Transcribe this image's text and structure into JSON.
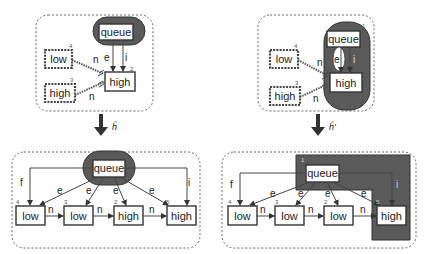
{
  "panels": {
    "top_left": {
      "queue": {
        "label": "queue",
        "num": "1"
      },
      "high": {
        "label": "high",
        "num": "2"
      },
      "low_pattern": {
        "label": "low",
        "num": "4"
      },
      "high_pattern": {
        "label": "high",
        "num": "3"
      },
      "edges": {
        "e": "e",
        "i": "i",
        "n1": "n",
        "n2": "n"
      }
    },
    "top_right": {
      "queue": {
        "label": "queue",
        "num": "1"
      },
      "high": {
        "label": "high",
        "num": "2"
      },
      "low_pattern": {
        "label": "low",
        "num": "4"
      },
      "high_pattern": {
        "label": "high",
        "num": "3"
      },
      "edges": {
        "e": "e",
        "i": "i",
        "n1": "n",
        "n2": "n"
      }
    },
    "bottom_left": {
      "queue": {
        "label": "queue",
        "num": "1"
      },
      "nodes": [
        {
          "label": "low",
          "num": "4"
        },
        {
          "label": "low",
          "num": "3"
        },
        {
          "label": "high",
          "num": "2"
        },
        {
          "label": "high",
          "num": "5"
        }
      ],
      "edges": {
        "f": "f",
        "i": "i",
        "e": "e",
        "n": "n"
      }
    },
    "bottom_right": {
      "queue": {
        "label": "queue",
        "num": "1"
      },
      "nodes": [
        {
          "label": "low",
          "num": "4"
        },
        {
          "label": "low",
          "num": "3"
        },
        {
          "label": "low",
          "num": "2"
        },
        {
          "label": "high",
          "num": "5"
        }
      ],
      "edges": {
        "f": "f",
        "i": "i",
        "e": "e",
        "n": "n"
      }
    }
  },
  "transforms": {
    "left": "ĥ",
    "right": "ĥ'"
  },
  "colors": {
    "blob": "#5a5a5a",
    "stroke": "#333333",
    "frame": "#666666"
  }
}
